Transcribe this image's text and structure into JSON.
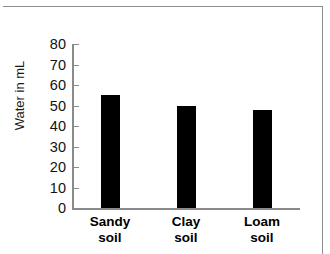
{
  "chart_data": {
    "type": "bar",
    "title": "",
    "subtitle": "",
    "xlabel": "",
    "ylabel": "Water in mL",
    "categories": [
      "Sandy soil",
      "Clay soil",
      "Loam soil"
    ],
    "category_lines": [
      [
        "Sandy",
        "soil"
      ],
      [
        "Clay",
        "soil"
      ],
      [
        "Loam",
        "soil"
      ]
    ],
    "values": [
      55,
      50,
      48
    ],
    "ylim": [
      0,
      80
    ],
    "ytick_step": 10,
    "ytick_labels": [
      "80",
      "70",
      "60",
      "50",
      "40",
      "30",
      "20",
      "10",
      "0"
    ],
    "ytick_values": [
      80,
      70,
      60,
      50,
      40,
      30,
      20,
      10,
      0
    ],
    "grid": false,
    "legend": false,
    "legend_position": "none",
    "bar_color": "#000000",
    "axis_color": "#8a8a8a",
    "text_color": "#111111"
  },
  "figure": {
    "border_color": "#8d8d8d",
    "background": "#ffffff"
  }
}
